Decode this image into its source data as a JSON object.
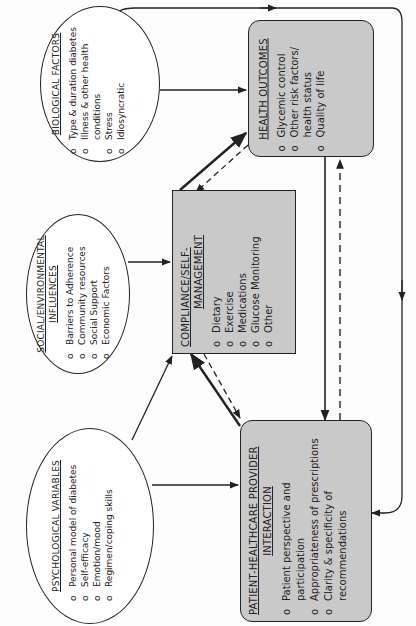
{
  "figure": {
    "caption": "FIG. 17.1. Diagram"
  },
  "nodes": {
    "biological": {
      "title": "BIOLOGICAL FACTORS",
      "items": [
        "Type & duration diabetes",
        "Illness & other health conditions",
        "Stress",
        "Idiosyncratic"
      ]
    },
    "social": {
      "title_line1": "SOCIAL/ENVIRONMENTAL",
      "title_line2": "INFLUENCES",
      "items": [
        "Barriers to Adherence",
        "Community resources",
        "Social Support",
        "Economic Factors"
      ]
    },
    "psychological": {
      "title": "PSYCHOLOGICAL VARIABLES",
      "items": [
        "Personal model of diabetes",
        "Self-efficacy",
        "Emotion/mood",
        "Regimen/coping skills"
      ]
    },
    "compliance": {
      "title_line1": "COMPLIANCE/SELF-",
      "title_line2": "MANAGEMENT",
      "items": [
        "Dietary",
        "Exercise",
        "Medications",
        "Glucose Monitoring",
        "Other"
      ]
    },
    "health_outcomes": {
      "title": "HEALTH OUTCOMES",
      "items": [
        "Glycemic control",
        "Other risk factors/ health status",
        "Quality of life"
      ]
    },
    "patient_provider": {
      "title_line1": "PATIENT-HEALTHCARE PROVIDER",
      "title_line2": "INTERACTION",
      "items": [
        "Patient perspective and participation",
        "Appropriateness of prescriptions",
        "Clarity & specificity of recommendations"
      ]
    }
  },
  "edges": [
    {
      "from": "biological",
      "to": "health_outcomes",
      "style": "solid"
    },
    {
      "from": "biological",
      "to": "patient_provider",
      "style": "solid",
      "route": "outer-loop"
    },
    {
      "from": "social",
      "to": "compliance",
      "style": "solid"
    },
    {
      "from": "psychological",
      "to": "compliance",
      "style": "solid"
    },
    {
      "from": "psychological",
      "to": "patient_provider",
      "style": "solid"
    },
    {
      "from": "compliance",
      "to": "health_outcomes",
      "style": "bold"
    },
    {
      "from": "health_outcomes",
      "to": "compliance",
      "style": "dashed"
    },
    {
      "from": "patient_provider",
      "to": "compliance",
      "style": "bold"
    },
    {
      "from": "compliance",
      "to": "patient_provider",
      "style": "dashed"
    },
    {
      "from": "health_outcomes",
      "to": "patient_provider",
      "style": "solid"
    },
    {
      "from": "patient_provider",
      "to": "health_outcomes",
      "style": "dashed"
    }
  ]
}
